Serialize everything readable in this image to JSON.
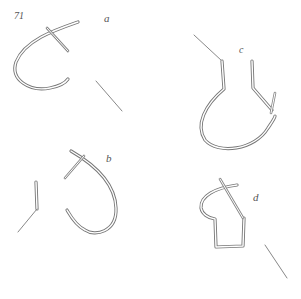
{
  "figure": {
    "number": "71",
    "panels": [
      {
        "id": "a",
        "label": "a"
      },
      {
        "id": "b",
        "label": "b"
      },
      {
        "id": "c",
        "label": "c"
      },
      {
        "id": "d",
        "label": "d"
      }
    ]
  }
}
